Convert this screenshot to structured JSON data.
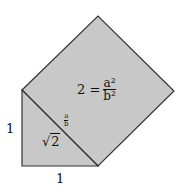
{
  "diagram": {
    "colors": {
      "fill": "#c8c8c8",
      "stroke": "#333333"
    },
    "triangle": {
      "points": [
        [
          22,
          90
        ],
        [
          22,
          166
        ],
        [
          98,
          166
        ]
      ]
    },
    "square": {
      "points": [
        [
          22,
          90
        ],
        [
          98,
          16
        ],
        [
          174,
          91
        ],
        [
          98,
          166
        ]
      ]
    },
    "labels": {
      "left_leg": "1",
      "bottom_leg": "1",
      "hypotenuse_radicand": "2",
      "hypotenuse_sqrt_symbol": "√",
      "ratio_numerator": "a",
      "ratio_denominator": "b",
      "equation_lhs": "2 =",
      "equation_numerator": "a²",
      "equation_denominator": "b²"
    }
  }
}
